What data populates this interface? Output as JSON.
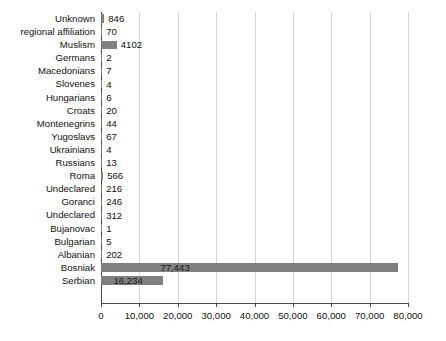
{
  "chart_data": {
    "type": "bar",
    "orientation": "horizontal",
    "title": "",
    "xlabel": "",
    "ylabel": "",
    "xlim": [
      0,
      80000
    ],
    "xticks": [
      0,
      10000,
      20000,
      30000,
      40000,
      50000,
      60000,
      70000,
      80000
    ],
    "xtick_labels": [
      "0",
      "10,000",
      "20,000",
      "30,000",
      "40,000",
      "50,000",
      "60,000",
      "70,000",
      "80,000"
    ],
    "grid": true,
    "legend": false,
    "bar_color": "#808080",
    "categories": [
      "Unknown",
      "regional affiliation",
      "Muslism",
      "Germans",
      "Macedonians",
      "Slovenes",
      "Hungarians",
      "Croats",
      "Montenegrins",
      "Yugoslavs",
      "Ukrainians",
      "Russians",
      "Roma",
      "Undeclared",
      "Goranci",
      "Undeclared",
      "Bujanovac",
      "Bulgarian",
      "Albanian",
      "Bosniak",
      "Serbian"
    ],
    "values": [
      846,
      70,
      4102,
      2,
      7,
      4,
      6,
      20,
      44,
      67,
      4,
      13,
      566,
      216,
      246,
      312,
      1,
      5,
      202,
      77443,
      16234
    ],
    "value_labels": [
      "846",
      "70",
      "4102",
      "2",
      "7",
      "4",
      "6",
      "20",
      "44",
      "67",
      "4",
      "13",
      "566",
      "216",
      "246",
      "312",
      "1",
      "5",
      "202",
      "77,443",
      "16,234"
    ]
  }
}
